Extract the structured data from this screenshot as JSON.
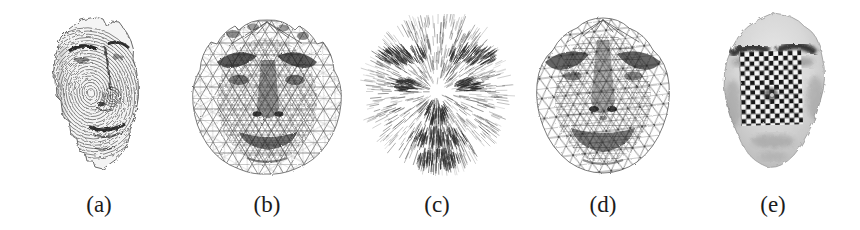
{
  "figure": {
    "background": "#ffffff",
    "ink_color": "#2f2f2f",
    "face_fill": "#d7d7d7",
    "checker_dark": "#151515",
    "checker_light": "#f6f6f6",
    "panels": [
      {
        "label": "(a)",
        "alt": "range-scan-face"
      },
      {
        "label": "(b)",
        "alt": "triangulated-mesh-face"
      },
      {
        "label": "(c)",
        "alt": "needle-normals-face"
      },
      {
        "label": "(d)",
        "alt": "refined-mesh-face"
      },
      {
        "label": "(e)",
        "alt": "shaded-face-checkerboard-patch"
      }
    ]
  }
}
